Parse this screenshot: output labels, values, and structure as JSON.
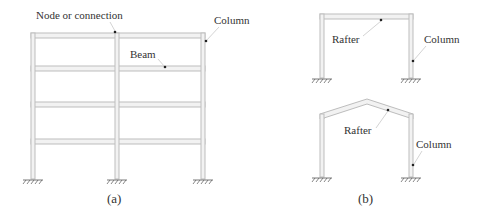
{
  "diagram": {
    "panel_a": {
      "caption": "(a)",
      "labels": {
        "node": "Node or connection",
        "column": "Column",
        "beam": "Beam"
      },
      "stories": 4,
      "bays": 2
    },
    "panel_b": {
      "caption": "(b)",
      "portal_flat": {
        "rafter": "Rafter",
        "column": "Column"
      },
      "portal_gabled": {
        "rafter": "Rafter",
        "column": "Column"
      }
    },
    "colors": {
      "member_fill": "#f2f2f2",
      "member_stroke": "#bdbdbd",
      "text": "#333333"
    }
  }
}
